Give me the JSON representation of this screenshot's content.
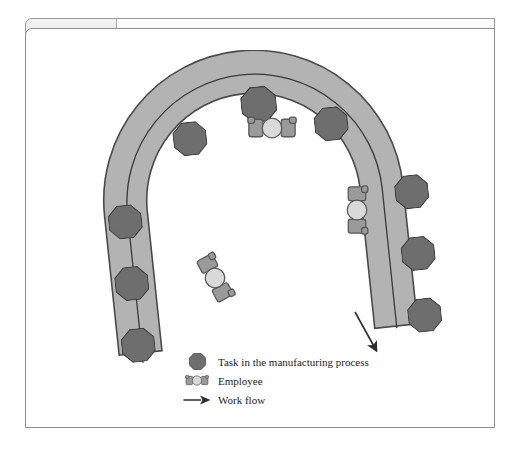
{
  "figure": {
    "number": "Figure 8.1",
    "title": "A U-Shaped Work Cell Layout"
  },
  "diagram": {
    "type": "u-shaped-work-cell",
    "task_station_count": 10,
    "employee_count": 3,
    "flow_direction": "counter-clockwise, entering bottom-left, exiting bottom-right",
    "colors": {
      "band_fill": "#b3b3b3",
      "band_outline": "#4a4a4a",
      "task_fill": "#6e6e6e",
      "task_outline": "#3d3d3d",
      "employee_body": "#9a9a9a",
      "employee_head": "#d9d9d9",
      "flow_line": "#3a3a3a",
      "frame_border": "#8d8d8d"
    },
    "task_stations": [
      {
        "id": "task-1",
        "label": "Task station 1"
      },
      {
        "id": "task-2",
        "label": "Task station 2"
      },
      {
        "id": "task-3",
        "label": "Task station 3"
      },
      {
        "id": "task-4",
        "label": "Task station 4"
      },
      {
        "id": "task-5",
        "label": "Task station 5"
      },
      {
        "id": "task-6",
        "label": "Task station 6"
      },
      {
        "id": "task-7",
        "label": "Task station 7"
      },
      {
        "id": "task-8",
        "label": "Task station 8"
      },
      {
        "id": "task-9",
        "label": "Task station 9"
      },
      {
        "id": "task-10",
        "label": "Task station 10"
      }
    ],
    "employees": [
      {
        "id": "employee-top",
        "label": "Employee at top of cell"
      },
      {
        "id": "employee-right",
        "label": "Employee at right side of cell"
      },
      {
        "id": "employee-bottom-left",
        "label": "Employee at bottom left of cell"
      }
    ]
  },
  "legend": {
    "items": [
      {
        "icon": "octagon-task-icon",
        "label": "Task in the manufacturing process"
      },
      {
        "icon": "employee-icon",
        "label": "Employee"
      },
      {
        "icon": "arrow-right-icon",
        "label": "Work flow"
      }
    ]
  }
}
